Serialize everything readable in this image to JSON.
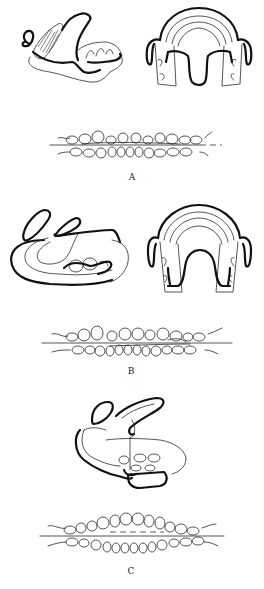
{
  "figure": {
    "panels": [
      {
        "id": "A",
        "label": "A",
        "views": [
          "lateral-appliance-view",
          "occlusal-appliance-view",
          "dental-arch-occlusion"
        ]
      },
      {
        "id": "B",
        "label": "B",
        "views": [
          "lateral-appliance-view",
          "occlusal-appliance-view",
          "dental-arch-occlusion"
        ]
      },
      {
        "id": "C",
        "label": "C",
        "views": [
          "lateral-appliance-view",
          "dental-arch-occlusion"
        ]
      }
    ],
    "colors": {
      "background": "#ffffff",
      "line": "#111111"
    }
  }
}
